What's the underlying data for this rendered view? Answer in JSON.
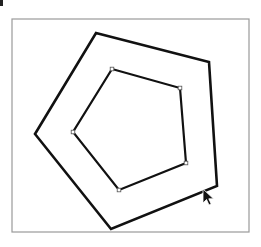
{
  "diagram": {
    "frame": {
      "x": 12,
      "y": 19,
      "width": 237,
      "height": 213,
      "stroke": "#9a9a9a"
    },
    "outer_pentagon": {
      "points": [
        [
          96,
          33
        ],
        [
          209,
          62
        ],
        [
          217,
          186
        ],
        [
          111,
          229
        ],
        [
          35,
          134
        ]
      ],
      "stroke": "#111111",
      "stroke_width": 2.6
    },
    "inner_pentagon": {
      "points": [
        [
          112,
          69
        ],
        [
          180,
          88
        ],
        [
          186,
          163
        ],
        [
          119,
          190
        ],
        [
          73,
          132
        ]
      ],
      "stroke": "#111111",
      "stroke_width": 2.2,
      "vertex_handles": true
    },
    "cursor": {
      "type": "arrow-pointer",
      "x": 203,
      "y": 189
    }
  }
}
